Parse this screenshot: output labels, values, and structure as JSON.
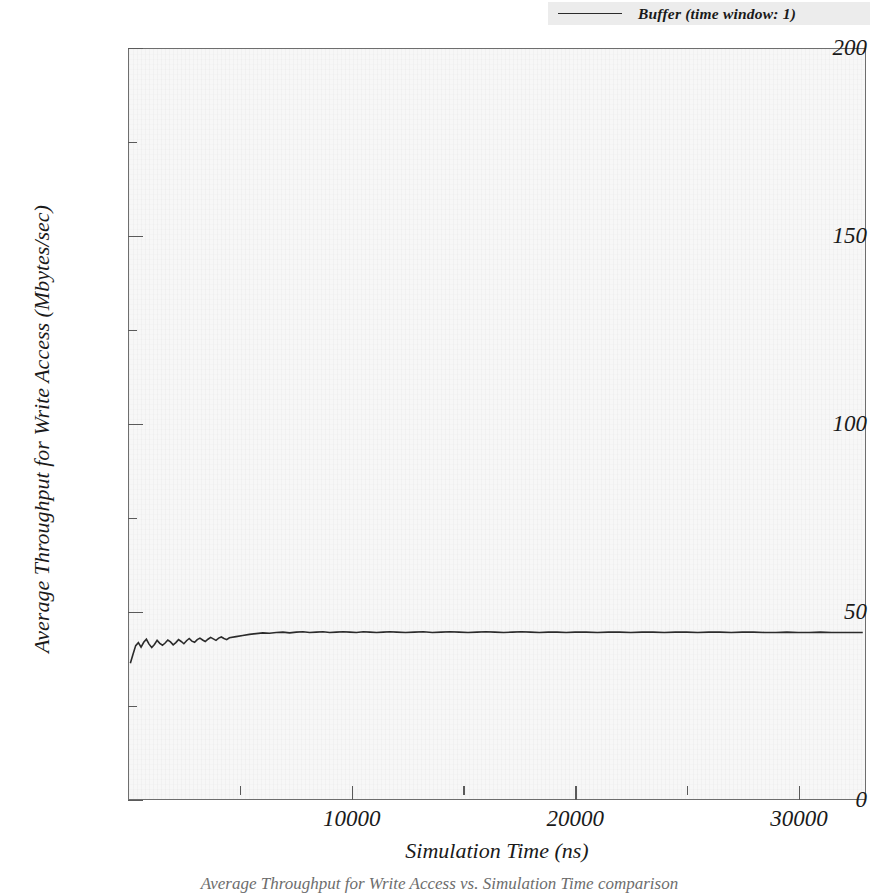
{
  "chart_data": {
    "type": "line",
    "title": "",
    "xlabel": "Simulation Time (ns)",
    "ylabel": "Average Throughput for Write Access (Mbytes/sec)",
    "xlim": [
      0,
      33000
    ],
    "ylim": [
      0,
      200
    ],
    "grid": false,
    "legend_position": "top-right",
    "x_major_ticks": [
      10000,
      20000,
      30000
    ],
    "x_major_tick_labels": [
      "10000",
      "20000",
      "30000"
    ],
    "x_minor_ticks": [
      5000,
      15000,
      25000
    ],
    "y_major_ticks": [
      0,
      50,
      100,
      150,
      200
    ],
    "y_major_tick_labels": [
      "0",
      "50",
      "100",
      "150",
      "200"
    ],
    "y_minor_ticks": [
      25,
      75,
      125,
      175
    ],
    "series": [
      {
        "name": "Buffer (time window: 1)",
        "color": "#2b2b2b",
        "x": [
          60,
          180,
          300,
          420,
          540,
          660,
          780,
          900,
          1020,
          1140,
          1260,
          1380,
          1500,
          1620,
          1740,
          1860,
          1980,
          2100,
          2220,
          2340,
          2460,
          2580,
          2700,
          2820,
          2940,
          3060,
          3180,
          3300,
          3420,
          3540,
          3660,
          3780,
          3900,
          4020,
          4140,
          4260,
          4380,
          4500,
          4800,
          5100,
          5400,
          5700,
          6000,
          6300,
          6600,
          6900,
          7200,
          7500,
          7800,
          8100,
          8400,
          8700,
          9000,
          9300,
          9600,
          9900,
          10200,
          10500,
          10800,
          11100,
          11400,
          11700,
          12000,
          12400,
          12800,
          13200,
          13600,
          14000,
          14400,
          14800,
          15200,
          15600,
          16000,
          16400,
          16800,
          17200,
          17600,
          18000,
          18400,
          18800,
          19200,
          19600,
          20000,
          20500,
          21000,
          21500,
          22000,
          22500,
          23000,
          23500,
          24000,
          24500,
          25000,
          25500,
          26000,
          26500,
          27000,
          27500,
          28000,
          28500,
          29000,
          29500,
          30000,
          30500,
          31000,
          31500,
          32000,
          32500,
          32900
        ],
        "y": [
          36.2,
          38.6,
          40.9,
          41.7,
          40.5,
          41.8,
          42.6,
          41.3,
          40.4,
          41.2,
          42.3,
          41.5,
          41.0,
          41.6,
          42.4,
          41.9,
          41.1,
          41.7,
          42.5,
          42.0,
          41.4,
          42.2,
          42.8,
          42.1,
          41.8,
          42.5,
          42.9,
          42.4,
          42.0,
          42.6,
          43.1,
          42.7,
          42.3,
          42.9,
          43.2,
          42.8,
          42.5,
          43.0,
          43.3,
          43.6,
          43.9,
          44.1,
          44.3,
          44.2,
          44.4,
          44.5,
          44.3,
          44.5,
          44.6,
          44.4,
          44.5,
          44.6,
          44.4,
          44.5,
          44.6,
          44.5,
          44.4,
          44.6,
          44.5,
          44.4,
          44.5,
          44.6,
          44.5,
          44.4,
          44.5,
          44.6,
          44.4,
          44.5,
          44.6,
          44.5,
          44.4,
          44.5,
          44.6,
          44.5,
          44.4,
          44.5,
          44.6,
          44.5,
          44.4,
          44.5,
          44.5,
          44.4,
          44.5,
          44.5,
          44.4,
          44.5,
          44.5,
          44.4,
          44.5,
          44.5,
          44.4,
          44.5,
          44.5,
          44.4,
          44.5,
          44.5,
          44.4,
          44.5,
          44.5,
          44.4,
          44.4,
          44.5,
          44.4,
          44.4,
          44.5,
          44.4,
          44.4,
          44.4,
          44.4
        ]
      }
    ]
  },
  "legend": {
    "entries": [
      {
        "label": "Buffer (time window: 1)",
        "color": "#2b2b2b"
      }
    ]
  },
  "axes": {
    "x_title": "Simulation Time (ns)",
    "y_title": "Average Throughput for Write Access (Mbytes/sec)"
  },
  "caption": {
    "text": "Average Throughput for Write Access vs. Simulation Time comparison"
  }
}
